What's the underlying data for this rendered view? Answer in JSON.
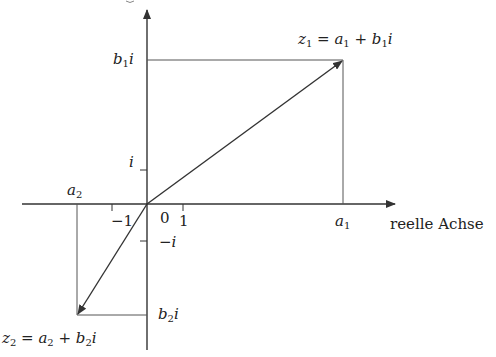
{
  "diagram": {
    "axes": {
      "real_axis_label": "reelle Achse",
      "origin_label": "0",
      "tick_one": "1",
      "tick_minus_one": "−1",
      "tick_i": "i",
      "tick_minus_i": "−i"
    },
    "points": {
      "z1": {
        "var": "z",
        "sub": "1",
        "eq": " = ",
        "a": "a",
        "a_sub": "1",
        "plus": " + ",
        "b": "b",
        "b_sub": "1",
        "i": "i"
      },
      "z2": {
        "var": "z",
        "sub": "2",
        "eq": " = ",
        "a": "a",
        "a_sub": "2",
        "plus": " + ",
        "b": "b",
        "b_sub": "2",
        "i": "i"
      }
    },
    "axis_labels": {
      "a1": {
        "name": "a",
        "sub": "1"
      },
      "a2": {
        "name": "a",
        "sub": "2"
      },
      "b1i": {
        "name": "b",
        "sub": "1",
        "i": "i"
      },
      "b2i": {
        "name": "b",
        "sub": "2",
        "i": "i"
      }
    },
    "colors": {
      "line": "#333333",
      "text": "#222222",
      "background": "#ffffff"
    }
  }
}
